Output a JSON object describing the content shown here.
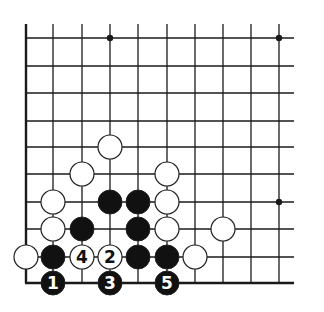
{
  "diagram": {
    "type": "go-board-fragment",
    "columns_x": [
      26,
      53,
      82,
      110,
      138,
      167,
      195,
      223,
      251,
      279
    ],
    "rows_y": [
      38,
      66,
      93,
      121,
      147,
      174,
      202,
      229,
      257,
      283
    ],
    "line_top": 24,
    "line_right": 294,
    "stone_radius": 12,
    "colors": {
      "line": "#1a1a1a",
      "black_stone": "#111111",
      "white_stone": "#ffffff",
      "stone_outline": "#222222"
    },
    "star_points": [
      {
        "col": 3,
        "row": 0
      },
      {
        "col": 9,
        "row": 0
      },
      {
        "col": 9,
        "row": 6
      }
    ],
    "stones": [
      {
        "col": 3,
        "row": 4,
        "color": "white",
        "label": ""
      },
      {
        "col": 2,
        "row": 5,
        "color": "white",
        "label": ""
      },
      {
        "col": 5,
        "row": 5,
        "color": "white",
        "label": ""
      },
      {
        "col": 1,
        "row": 6,
        "color": "white",
        "label": ""
      },
      {
        "col": 3,
        "row": 6,
        "color": "black",
        "label": ""
      },
      {
        "col": 4,
        "row": 6,
        "color": "black",
        "label": ""
      },
      {
        "col": 5,
        "row": 6,
        "color": "white",
        "label": ""
      },
      {
        "col": 1,
        "row": 7,
        "color": "white",
        "label": ""
      },
      {
        "col": 2,
        "row": 7,
        "color": "black",
        "label": ""
      },
      {
        "col": 4,
        "row": 7,
        "color": "black",
        "label": ""
      },
      {
        "col": 5,
        "row": 7,
        "color": "white",
        "label": ""
      },
      {
        "col": 7,
        "row": 7,
        "color": "white",
        "label": ""
      },
      {
        "col": 0,
        "row": 8,
        "color": "white",
        "label": ""
      },
      {
        "col": 1,
        "row": 8,
        "color": "black",
        "label": ""
      },
      {
        "col": 2,
        "row": 8,
        "color": "white",
        "label": "4"
      },
      {
        "col": 3,
        "row": 8,
        "color": "white",
        "label": "2"
      },
      {
        "col": 4,
        "row": 8,
        "color": "black",
        "label": ""
      },
      {
        "col": 5,
        "row": 8,
        "color": "black",
        "label": ""
      },
      {
        "col": 6,
        "row": 8,
        "color": "white",
        "label": ""
      },
      {
        "col": 1,
        "row": 9,
        "color": "black",
        "label": "1"
      },
      {
        "col": 3,
        "row": 9,
        "color": "black",
        "label": "3"
      },
      {
        "col": 5,
        "row": 9,
        "color": "black",
        "label": "5"
      }
    ]
  }
}
